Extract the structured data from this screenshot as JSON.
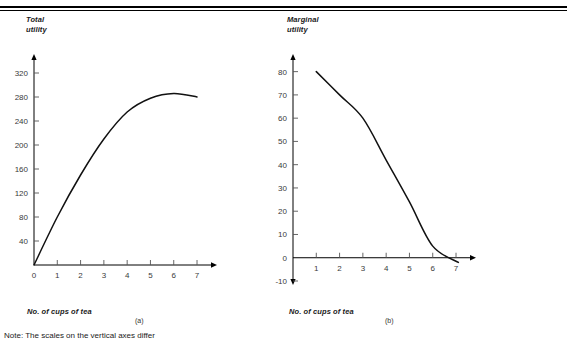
{
  "figure": {
    "note": "Note: The scales on the vertical axes differ"
  },
  "panel_a": {
    "y_axis_title": "Total\nutility",
    "x_axis_title": "No. of cups of tea",
    "caption": "(a)"
  },
  "panel_b": {
    "y_axis_title": "Marginal\nutility",
    "x_axis_title": "No. of cups of tea",
    "caption": "(b)"
  },
  "chart_data": [
    {
      "type": "line",
      "id": "total-utility",
      "title": "Total utility",
      "xlabel": "No. of cups of tea",
      "ylabel": "Total utility",
      "caption": "(a)",
      "xlim": [
        0,
        7.6
      ],
      "ylim": [
        0,
        345
      ],
      "grid": false,
      "legend": "none",
      "xticks": [
        0,
        1,
        2,
        3,
        4,
        5,
        6,
        7
      ],
      "xtick_labels": [
        "0",
        "1",
        "2",
        "3",
        "4",
        "5",
        "6",
        "7"
      ],
      "yticks": [
        40,
        80,
        120,
        160,
        200,
        240,
        280,
        320
      ],
      "ytick_labels": [
        "40",
        "80",
        "120",
        "160",
        "200",
        "240",
        "280",
        "320"
      ],
      "x": [
        0,
        1,
        2,
        3,
        4,
        5,
        6,
        7
      ],
      "values": [
        0,
        80,
        150,
        210,
        255,
        278,
        286,
        280
      ]
    },
    {
      "type": "line",
      "id": "marginal-utility",
      "title": "Marginal utility",
      "xlabel": "No. of cups of tea",
      "ylabel": "Marginal utility",
      "caption": "(b)",
      "xlim": [
        0,
        7.6
      ],
      "ylim": [
        -10,
        85
      ],
      "grid": false,
      "legend": "none",
      "xticks": [
        1,
        2,
        3,
        4,
        5,
        6,
        7
      ],
      "xtick_labels": [
        "1",
        "2",
        "3",
        "4",
        "5",
        "6",
        "7"
      ],
      "yticks": [
        -10,
        0,
        10,
        20,
        30,
        40,
        50,
        60,
        70,
        80
      ],
      "ytick_labels": [
        "-10",
        "0",
        "10",
        "20",
        "30",
        "40",
        "50",
        "60",
        "70",
        "80"
      ],
      "x": [
        1,
        2,
        3,
        4,
        5,
        6,
        7.1
      ],
      "values": [
        80,
        70,
        60,
        42,
        24,
        5,
        -2
      ]
    }
  ]
}
